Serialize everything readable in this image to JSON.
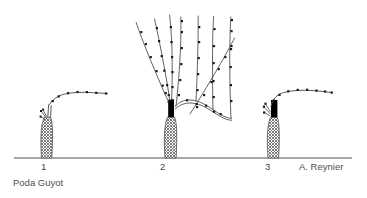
{
  "figure": {
    "title": "Poda Guyot",
    "credit": "A. Reynier",
    "background_color": "#ffffff",
    "line_color": "#5a5a5a",
    "bud_color": "#1a1a1a",
    "trunk_fill_color": "#8f8f8f",
    "spur_color": "#000000",
    "ground_color": "#8a8a8a",
    "text_color": "#4f4f4f"
  },
  "stages": [
    {
      "number": "1",
      "name": "pruned-vine-one-cane",
      "description": "Vine with hatched trunk and a single arched fruiting cane bent to the right, bearing buds; small cut stubs at the head.",
      "trunk": {
        "x": 44,
        "ground_y": 158,
        "top_y": 116,
        "width": 14
      },
      "spur": null,
      "cane_buds": 7,
      "shoots": 0
    },
    {
      "number": "2",
      "name": "vine-with-summer-growth",
      "description": "Vine with black renewal spur at head, several upright shoots bearing nodes, and an arched horizontal cane carrying further upright shoots.",
      "trunk": {
        "x": 170,
        "ground_y": 158,
        "top_y": 116,
        "width": 15
      },
      "spur": {
        "x": 166,
        "y": 100,
        "width": 6,
        "height": 17
      },
      "cane_buds": 0,
      "shoots": 7
    },
    {
      "number": "3",
      "name": "pruned-vine-with-spur-and-cane",
      "description": "Vine with black renewal spur and a single arched fruiting cane to the right bearing buds; cut stubs at the head.",
      "trunk": {
        "x": 272,
        "ground_y": 158,
        "top_y": 116,
        "width": 14
      },
      "spur": {
        "x": 270,
        "y": 101,
        "width": 7,
        "height": 18
      },
      "cane_buds": 8,
      "shoots": 0
    }
  ],
  "ground": {
    "name": "ground-line",
    "x1": 14,
    "x2": 352,
    "y": 158
  }
}
